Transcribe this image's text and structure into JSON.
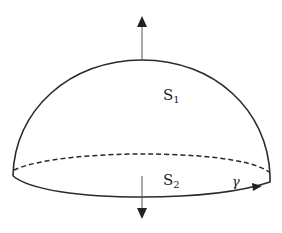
{
  "diagram": {
    "labels": {
      "upper_surface": "S",
      "upper_surface_sub": "1",
      "base_disk": "S",
      "base_disk_sub": "2",
      "boundary_curve": "γ"
    },
    "colors": {
      "stroke": "#2a2a2a",
      "arrow": "#555555",
      "background": "#ffffff"
    },
    "elements": [
      {
        "type": "hemisphere-dome",
        "name": "S1"
      },
      {
        "type": "base-ellipse",
        "name": "S2",
        "back_half": "dashed",
        "front_half": "solid"
      },
      {
        "type": "normal-arrow",
        "direction": "up",
        "on": "S1"
      },
      {
        "type": "normal-arrow",
        "direction": "down",
        "on": "S2"
      },
      {
        "type": "orientation-arrow",
        "on": "gamma",
        "direction": "counterclockwise-from-above"
      }
    ]
  }
}
